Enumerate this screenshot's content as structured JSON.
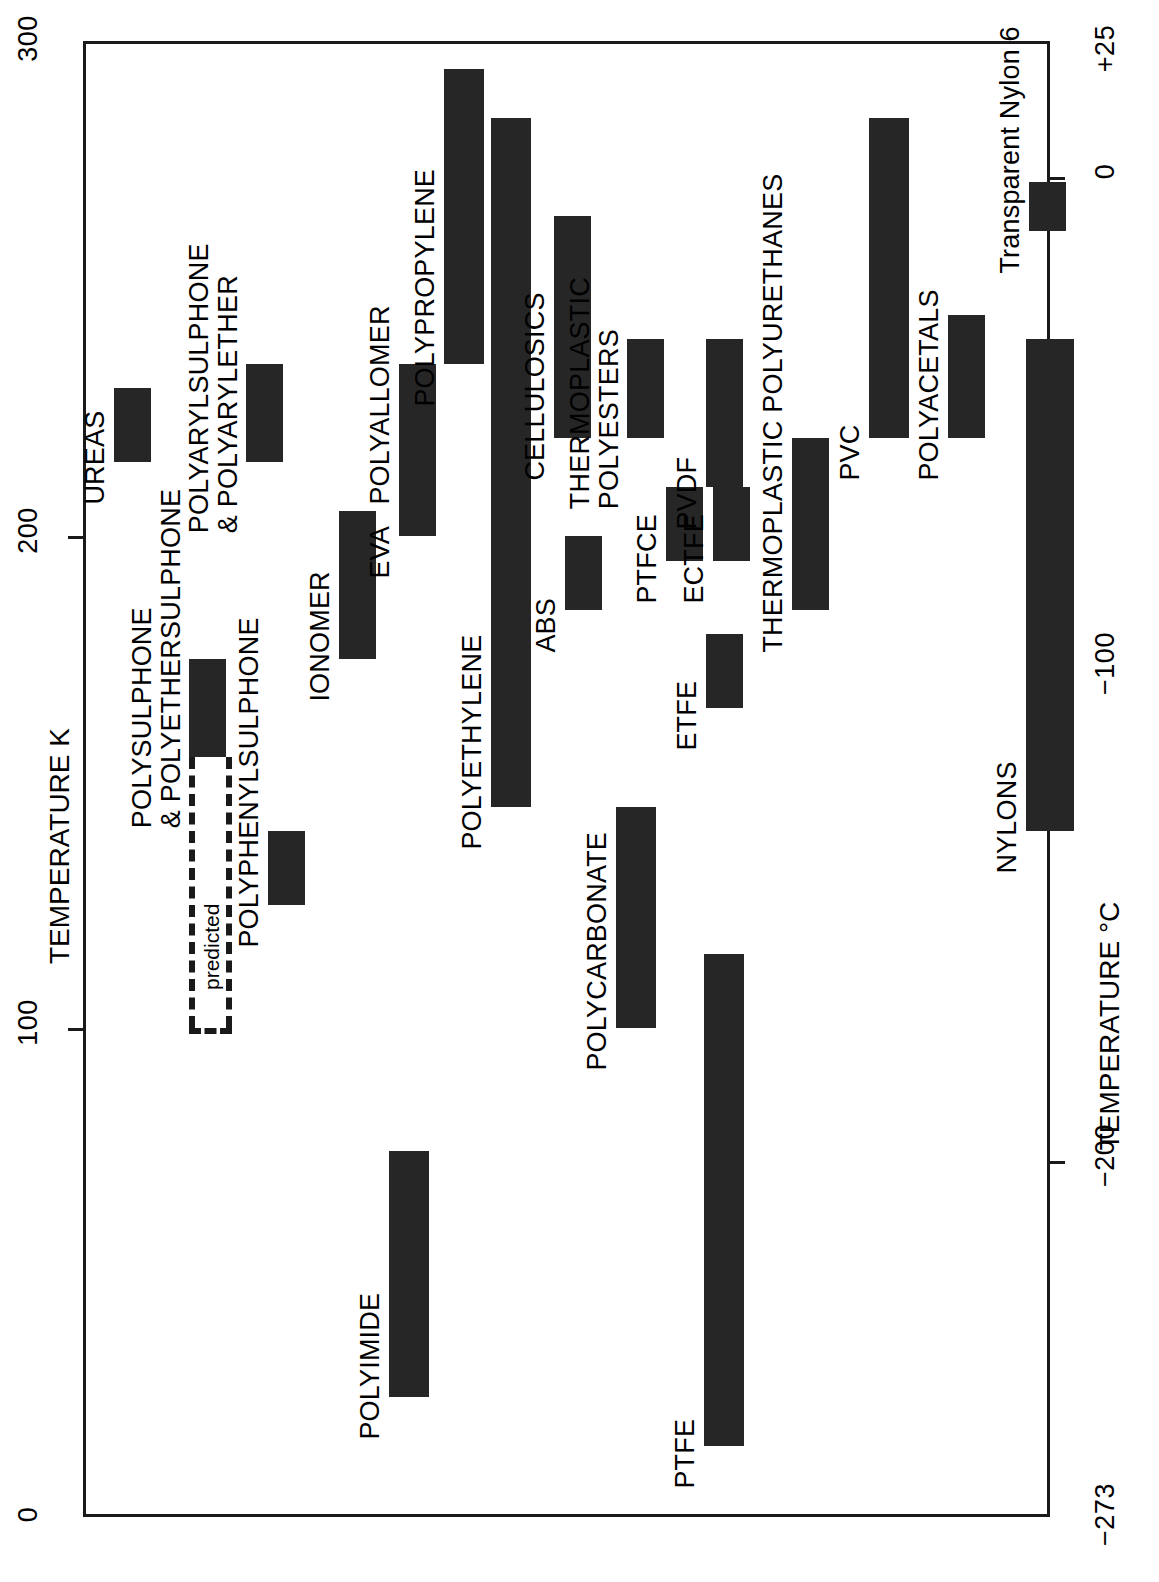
{
  "chart_data": {
    "type": "bar",
    "orientation": "rotated-90",
    "title": "",
    "xlabel": "",
    "ylabel": "TEMPERATURE K",
    "y2label": "TEMPERATURE °C",
    "ylim": [
      0,
      300
    ],
    "y2lim": [
      -273,
      25
    ],
    "grid": false,
    "legend": null,
    "y_ticks": [
      "300",
      "200",
      "100",
      "0"
    ],
    "y_tick_values": [
      300,
      200,
      100,
      0
    ],
    "y2_ticks": [
      "+25",
      "0",
      "−100",
      "−200",
      "−273"
    ],
    "y2_tick_values": [
      25,
      0,
      -100,
      -200,
      -273
    ],
    "value_unit": "K",
    "categories": [
      "UREAS",
      "POLYARYLSULPHONE\n& POLYARYLETHER",
      "POLYSULPHONE\n& POLYETHERSULPHONE",
      "POLYPHENYLSULPHONE",
      "POLYIMIDE",
      "IONOMER",
      "EVA",
      "POLYALLOMER",
      "POLYPROPYLENE",
      "POLYETHYLENE",
      "ABS",
      "CELLULOSICS",
      "POLYCARBONATE",
      "THERMOPLASTIC\nPOLYESTERS",
      "PTFCE",
      "PTFE",
      "ETFE",
      "ECTFE",
      "PVDF",
      "THERMOPLASTIC POLYURETHANES",
      "PVC",
      "NYLONS",
      "POLYACETALS",
      "Transparent Nylon 6"
    ],
    "series": [
      {
        "name": "Service temperature range (K)",
        "ranges": [
          {
            "label": "UREAS",
            "min": 215,
            "max": 230,
            "note": ""
          },
          {
            "label": "POLYARYLSULPHONE\n& POLYARYLETHER",
            "min": 215,
            "max": 235,
            "note": ""
          },
          {
            "label": "POLYSULPHONE\n& POLYETHERSULPHONE",
            "min": 155,
            "max": 175,
            "note": "predicted extension down to 100 K"
          },
          {
            "label": "POLYPHENYLSULPHONE",
            "min": 125,
            "max": 140,
            "note": ""
          },
          {
            "label": "POLYIMIDE",
            "min": 25,
            "max": 75,
            "note": ""
          },
          {
            "label": "IONOMER",
            "min": 175,
            "max": 205,
            "note": ""
          },
          {
            "label": "EVA",
            "min": 200,
            "max": 215,
            "note": ""
          },
          {
            "label": "POLYALLOMER",
            "min": 215,
            "max": 235,
            "note": ""
          },
          {
            "label": "POLYPROPYLENE",
            "min": 235,
            "max": 295,
            "note": ""
          },
          {
            "label": "POLYETHYLENE",
            "min": 145,
            "max": 285,
            "note": ""
          },
          {
            "label": "ABS",
            "min": 185,
            "max": 200,
            "note": ""
          },
          {
            "label": "CELLULOSICS",
            "min": 220,
            "max": 265,
            "note": ""
          },
          {
            "label": "POLYCARBONATE",
            "min": 100,
            "max": 145,
            "note": ""
          },
          {
            "label": "THERMOPLASTIC\nPOLYESTERS",
            "min": 220,
            "max": 240,
            "note": ""
          },
          {
            "label": "PTFCE",
            "min": 195,
            "max": 210,
            "note": ""
          },
          {
            "label": "PTFE",
            "min": 15,
            "max": 115,
            "note": ""
          },
          {
            "label": "ETFE",
            "min": 165,
            "max": 180,
            "note": ""
          },
          {
            "label": "ECTFE",
            "min": 195,
            "max": 210,
            "note": ""
          },
          {
            "label": "PVDF",
            "min": 210,
            "max": 240,
            "note": ""
          },
          {
            "label": "THERMOPLASTIC POLYURETHANES",
            "min": 185,
            "max": 220,
            "note": ""
          },
          {
            "label": "PVC",
            "min": 220,
            "max": 285,
            "note": ""
          },
          {
            "label": "NYLONS",
            "min": 140,
            "max": 240,
            "note": ""
          },
          {
            "label": "POLYACETALS",
            "min": 220,
            "max": 245,
            "note": ""
          },
          {
            "label": "Transparent Nylon 6",
            "min": 262,
            "max": 272,
            "note": ""
          }
        ]
      }
    ],
    "annotations": [
      {
        "text": "predicted",
        "refers_to": "POLYSULPHONE & POLYETHERSULPHONE",
        "style": "dashed"
      }
    ]
  },
  "axes": {
    "left_title": "TEMPERATURE K",
    "right_title": "TEMPERATURE °C",
    "left_ticks": [
      "300",
      "200",
      "100",
      "0"
    ],
    "right_ticks": [
      "+25",
      "0",
      "−100",
      "−200",
      "−273"
    ]
  },
  "bars": [
    {
      "name": "ureas",
      "label": "UREAS",
      "min": 215,
      "max": 230,
      "track": 0
    },
    {
      "name": "polyarylsulphone",
      "label": "POLYARYLSULPHONE\n& POLYARYLETHER",
      "min": 215,
      "max": 235,
      "track": 1
    },
    {
      "name": "polysulphone",
      "label": "POLYSULPHONE\n& POLYETHERSULPHONE",
      "min": 155,
      "max": 175,
      "track": 2
    },
    {
      "name": "polyphenylsulphone",
      "label": "POLYPHENYLSULPHONE",
      "min": 125,
      "max": 140,
      "track": 3
    },
    {
      "name": "polyimide",
      "label": "POLYIMIDE",
      "min": 25,
      "max": 75,
      "track": 4
    },
    {
      "name": "ionomer",
      "label": "IONOMER",
      "min": 175,
      "max": 205,
      "track": 5
    },
    {
      "name": "eva",
      "label": "EVA",
      "min": 200,
      "max": 215,
      "track": 6
    },
    {
      "name": "polyallomer",
      "label": "POLYALLOMER",
      "min": 215,
      "max": 235,
      "track": 7
    },
    {
      "name": "polypropylene",
      "label": "POLYPROPYLENE",
      "min": 235,
      "max": 295,
      "track": 8
    },
    {
      "name": "polyethylene",
      "label": "POLYETHYLENE",
      "min": 145,
      "max": 285,
      "track": 9
    },
    {
      "name": "abs",
      "label": "ABS",
      "min": 185,
      "max": 200,
      "track": 10
    },
    {
      "name": "cellulosics",
      "label": "CELLULOSICS",
      "min": 220,
      "max": 265,
      "track": 11
    },
    {
      "name": "polycarbonate",
      "label": "POLYCARBONATE",
      "min": 100,
      "max": 145,
      "track": 12
    },
    {
      "name": "thermoplastic-polyesters",
      "label": "THERMOPLASTIC\nPOLYESTERS",
      "min": 220,
      "max": 240,
      "track": 13
    },
    {
      "name": "ptfce",
      "label": "PTFCE",
      "min": 195,
      "max": 210,
      "track": 14
    },
    {
      "name": "ptfe",
      "label": "PTFE",
      "min": 15,
      "max": 115,
      "track": 15
    },
    {
      "name": "etfe",
      "label": "ETFE",
      "min": 165,
      "max": 180,
      "track": 16
    },
    {
      "name": "ectfe",
      "label": "ECTFE",
      "min": 195,
      "max": 210,
      "track": 17
    },
    {
      "name": "pvdf",
      "label": "PVDF",
      "min": 210,
      "max": 240,
      "track": 18
    },
    {
      "name": "thermoplastic-polyurethanes",
      "label": "THERMOPLASTIC POLYURETHANES",
      "min": 185,
      "max": 220,
      "track": 19
    },
    {
      "name": "pvc",
      "label": "PVC",
      "min": 220,
      "max": 285,
      "track": 20
    },
    {
      "name": "nylons",
      "label": "NYLONS",
      "min": 140,
      "max": 240,
      "track": 21
    },
    {
      "name": "polyacetals",
      "label": "POLYACETALS",
      "min": 220,
      "max": 245,
      "track": 22
    },
    {
      "name": "transparent-nylon-6",
      "label": "Transparent Nylon 6",
      "min": 262,
      "max": 272,
      "track": 23
    }
  ],
  "annotation": {
    "predicted_label": "predicted"
  }
}
